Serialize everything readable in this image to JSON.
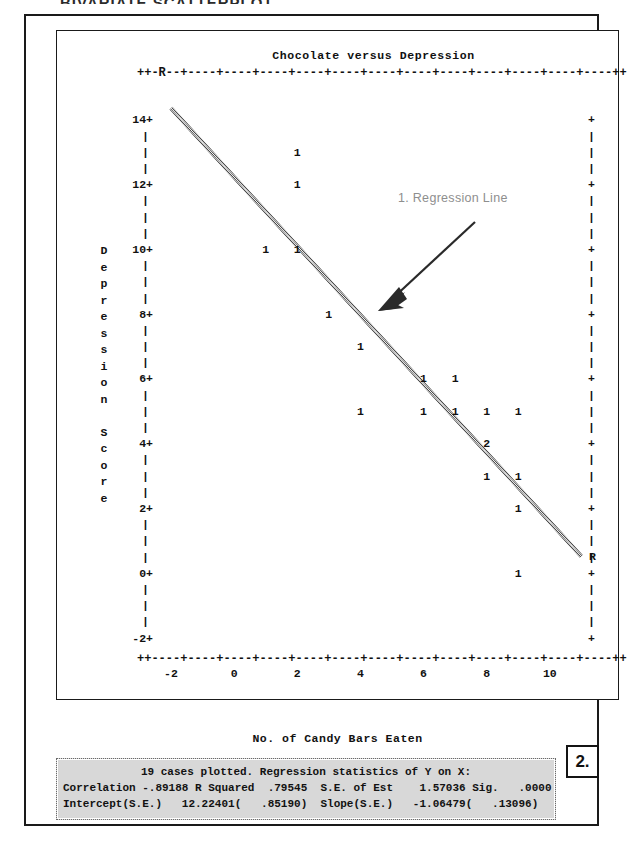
{
  "page": {
    "top_cropped_text": "BIVARIATE SCATTERPLOT"
  },
  "chart": {
    "title": "Chocolate versus Depression",
    "x_axis_caption": "No. of Candy Bars Eaten",
    "y_axis_caption_chars": [
      "D",
      "e",
      "p",
      "r",
      "e",
      "s",
      "s",
      "i",
      "o",
      "n",
      "",
      "S",
      "c",
      "o",
      "r",
      "e"
    ],
    "top_rail": "++-R--+----+----+----+----+----+----+----+----+----+----+----+----++",
    "bottom_rail": "++----+----+----+----+----+----+----+----+----+----+----+----+----++",
    "y_tick_labels": [
      "14+",
      "12+",
      "10+",
      "8+",
      "6+",
      "4+",
      "2+",
      "0+",
      "-2+"
    ],
    "y_minor_mark": "|",
    "y_right_major": "+",
    "y_right_minor": "|",
    "regression_endpoint_marker": "R",
    "x_tick_labels": [
      "-2",
      "0",
      "2",
      "4",
      "6",
      "8",
      "10"
    ],
    "point_glyph_single": "1",
    "point_glyph_double": "2"
  },
  "annotations": {
    "callout_1_label": "1. Regression Line",
    "callout_2_label": "2."
  },
  "stats": {
    "line1": "19 cases plotted. Regression statistics of Y on X:",
    "line2": "Correlation -.89188 R Squared  .79545  S.E. of Est    1.57036 Sig.   .0000",
    "line3": "Intercept(S.E.)   12.22401(   .85190)  Slope(S.E.)   -1.06479(   .13096)",
    "n_cases": 19,
    "correlation": -0.89188,
    "r_squared": 0.79545,
    "se_of_est": 1.57036,
    "sig": 0.0,
    "intercept": 12.22401,
    "intercept_se": 0.8519,
    "slope": -1.06479,
    "slope_se": 0.13096
  },
  "colors": {
    "ink": "#111111",
    "frame": "#1a1a1a",
    "annotation_gray": "#8e8e8e",
    "panel_fill": "#d8d8d8",
    "regression_line": "#8a8a8a"
  },
  "chart_data": {
    "type": "scatter",
    "title": "Chocolate versus Depression",
    "xlabel": "No. of Candy Bars Eaten",
    "ylabel": "Depression Score",
    "xlim": [
      -2.6,
      11.4
    ],
    "ylim": [
      -2.6,
      15.0
    ],
    "xticks": [
      -2,
      0,
      2,
      4,
      6,
      8,
      10
    ],
    "yticks": [
      -2,
      0,
      2,
      4,
      6,
      8,
      10,
      12,
      14
    ],
    "grid": false,
    "legend": "none",
    "marker_label": "count of cases at point",
    "points": [
      {
        "x": 2,
        "y": 13,
        "count": 1
      },
      {
        "x": 2,
        "y": 12,
        "count": 1
      },
      {
        "x": 1,
        "y": 10,
        "count": 1
      },
      {
        "x": 2,
        "y": 10,
        "count": 1
      },
      {
        "x": 3,
        "y": 8,
        "count": 1
      },
      {
        "x": 4,
        "y": 7,
        "count": 1
      },
      {
        "x": 6,
        "y": 6,
        "count": 1
      },
      {
        "x": 7,
        "y": 6,
        "count": 1
      },
      {
        "x": 4,
        "y": 5,
        "count": 1
      },
      {
        "x": 6,
        "y": 5,
        "count": 1
      },
      {
        "x": 7,
        "y": 5,
        "count": 1
      },
      {
        "x": 8,
        "y": 5,
        "count": 1
      },
      {
        "x": 9,
        "y": 5,
        "count": 1
      },
      {
        "x": 8,
        "y": 4,
        "count": 2
      },
      {
        "x": 8,
        "y": 3,
        "count": 1
      },
      {
        "x": 9,
        "y": 3,
        "count": 1
      },
      {
        "x": 9,
        "y": 2,
        "count": 1
      },
      {
        "x": 9,
        "y": 0,
        "count": 1
      }
    ],
    "regression": {
      "intercept": 12.22401,
      "slope": -1.06479,
      "endpoints": [
        {
          "x": -2,
          "y": 14.35
        },
        {
          "x": 11,
          "y": 0.51
        }
      ],
      "endpoint_marker": "R",
      "color": "#8a8a8a"
    }
  }
}
